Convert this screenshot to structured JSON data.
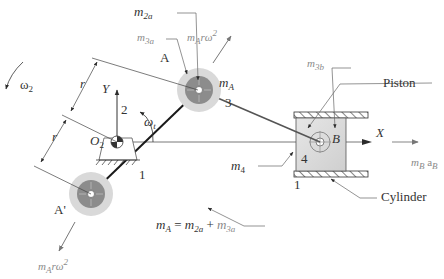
{
  "diagram": {
    "labels": {
      "omega2": "ω",
      "omega2_sub": "2",
      "omega_t": "ω",
      "omega_t_sub": "t",
      "m2a": "m",
      "m2a_sub": "2a",
      "m3a": "m",
      "m3a_sub": "3a",
      "m3b": "m",
      "m3b_sub": "3b",
      "m4": "m",
      "m4_sub": "4",
      "mA": "m",
      "mA_sub": "A",
      "point_A": "A",
      "point_A_prime": "A'",
      "point_B": "B",
      "O2": "O",
      "O2_sub": "2",
      "axis_Y": "Y",
      "axis_X": "X",
      "r_upper": "r",
      "r_lower": "r",
      "link_2": "2",
      "link_3": "3",
      "link_4": "4",
      "ground_1_left": "1",
      "ground_1_right": "1",
      "piston": "Piston",
      "cylinder": "Cylinder",
      "force_A": "m",
      "force_A_sub": "A",
      "force_A_tail": "rω",
      "force_A_sup": "2",
      "force_A_prime": "m",
      "force_A_prime_sub": "A",
      "force_A_prime_tail": "rω",
      "force_A_prime_sup": "2",
      "force_B_m": "m",
      "force_B_m_sub": "B",
      "force_B_a": "a",
      "force_B_a_sub": "B",
      "equation_lhs": "m",
      "equation_lhs_sub": "A",
      "equation_eq": " = ",
      "equation_t1": "m",
      "equation_t1_sub": "2a",
      "equation_plus": " + ",
      "equation_t2": "m",
      "equation_t2_sub": "3a"
    },
    "colors": {
      "ink": "#2b2b2b",
      "faint_ink": "#8a8a8a",
      "mass_outer": "#d9d9d9",
      "mass_inner": "#8c8c8c",
      "piston_fill": "#dcdcdc",
      "leader": "#555555"
    }
  }
}
